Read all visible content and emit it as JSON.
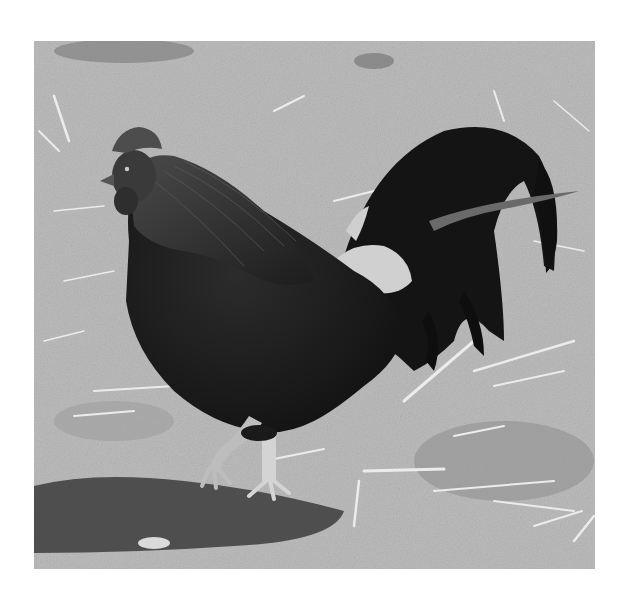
{
  "image": {
    "subject": "rooster",
    "description": "Black-and-white photograph of a dark-feathered rooster walking on dirt ground scattered with straw",
    "frame": {
      "x": 34,
      "y": 41,
      "width": 561,
      "height": 528
    },
    "colors": {
      "page_background": "#ffffff",
      "ground": "#b9b9b9",
      "ground_dark": "#8f8f8f",
      "straw": "#e6e6e6",
      "feathers": "#1a1a1a",
      "hackle": "#3a3a3a",
      "saddle_light": "#d2d2d2",
      "legs": "#cfcfcf",
      "shadow": "#3c3c3c"
    }
  }
}
